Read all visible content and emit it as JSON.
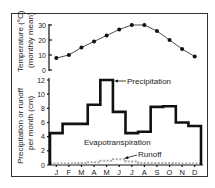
{
  "chart_data": [
    {
      "type": "line",
      "title": "",
      "ylabel": "Temperature (°C) (monthly mean)",
      "ylabel_line1": "Temperature (°C)",
      "ylabel_line2": "(monthly mean)",
      "xlabel": "",
      "categories": [
        "J",
        "F",
        "M",
        "A",
        "M",
        "J",
        "J",
        "A",
        "S",
        "O",
        "N",
        "D"
      ],
      "series": [
        {
          "name": "Temperature",
          "values": [
            8,
            10,
            15,
            19,
            23,
            27,
            30,
            30,
            26,
            20,
            14,
            9
          ]
        }
      ],
      "yticks": [
        0,
        10,
        20,
        30
      ],
      "ylim": [
        0,
        30
      ],
      "grid": false
    },
    {
      "type": "line",
      "title": "",
      "ylabel": "Precipitation or runoff per month (cm)",
      "ylabel_line1": "Precipitation or runoff",
      "ylabel_line2": "per month (cm)",
      "xlabel": "",
      "categories": [
        "J",
        "F",
        "M",
        "A",
        "M",
        "J",
        "J",
        "A",
        "S",
        "O",
        "N",
        "D"
      ],
      "series": [
        {
          "name": "Precipitation",
          "style": "step",
          "values": [
            4.5,
            5.8,
            5.8,
            8.5,
            12.0,
            7.5,
            4.5,
            4.7,
            8.2,
            8.3,
            6.0,
            5.5
          ]
        },
        {
          "name": "Runoff",
          "style": "dashed-gray",
          "values": [
            0.2,
            0.2,
            0.3,
            0.4,
            0.6,
            0.8,
            0.5,
            0.3,
            0.3,
            0.3,
            0.2,
            0.2
          ]
        }
      ],
      "annotations": [
        "Precipitation",
        "Evapotranspiration",
        "Runoff"
      ],
      "yticks": [
        0,
        2,
        4,
        6,
        8,
        10,
        12
      ],
      "ylim": [
        0,
        12
      ],
      "grid": false
    }
  ],
  "labels": {
    "precipitation": "Precipitation",
    "evapotranspiration": "Evapotranspiration",
    "runoff": "Runoff"
  }
}
